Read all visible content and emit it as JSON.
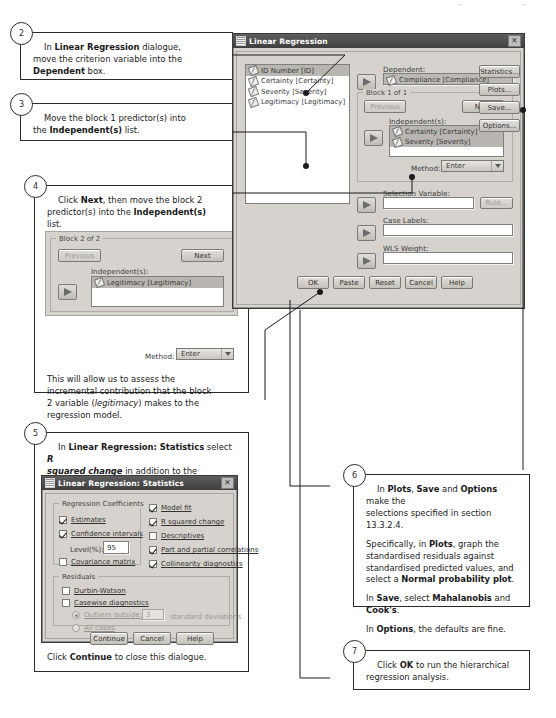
{
  "page": {
    "top_marks": [
      "⌐",
      "⌐"
    ]
  },
  "callouts": {
    "step2": {
      "number": "2",
      "text_html": "In <b>Linear Regression</b> dialogue, move the criterion variable into the <b>Dependent</b> box.",
      "line1_pre": "In ",
      "line1_bold": "Linear Regression",
      "line1_post": " dialogue,",
      "line2": "move the criterion variable into the",
      "line3_bold": "Dependent",
      "line3_post": " box."
    },
    "step3": {
      "number": "3",
      "line1": "Move the block 1 predictor(s) into",
      "line2_pre": "the ",
      "line2_bold": "Independent(s)",
      "line2_post": " list."
    },
    "step4": {
      "number": "4",
      "line1_pre": "Click ",
      "line1_bold": "Next",
      "line1_post": ", then move the block 2",
      "line2_pre": "predictor(s) into the ",
      "line2_bold": "Independent(s)",
      "line3": "list.",
      "note1": "This will allow us to assess the",
      "note2": "incremental contribution that the block",
      "note3_pre": "2 variable (",
      "note3_italic": "legitimacy",
      "note3_post": ") makes to the",
      "note4": "regression model."
    },
    "step5": {
      "number": "5",
      "line1_pre": "In ",
      "line1_bold": "Linear Regression: Statistics",
      "line1_post": " select ",
      "line1_bolditalic": "R",
      "line2_bolditalic": "squared change",
      "line2_post": " in addition to the selections",
      "line3": "made in section 13.3.2.4.",
      "footer_pre": "Click ",
      "footer_bold": "Continue",
      "footer_post": " to close this dialogue."
    },
    "step6": {
      "number": "6",
      "p1_a": "In ",
      "p1_b1": "Plots",
      "p1_b": ", ",
      "p1_b2": "Save",
      "p1_c": " and ",
      "p1_b3": "Options",
      "p1_d": " make the",
      "p1_l2": "selections specified in section 13.3.2.4.",
      "p2_a": "Specifically, in ",
      "p2_b1": "Plots",
      "p2_b": ", graph the",
      "p2_l2": "standardised residuals against",
      "p2_l3": "standardised predicted values, and",
      "p2_l4_a": "select a ",
      "p2_l4_b": "Normal probability plot",
      "p2_l4_c": ".",
      "p3_a": "In ",
      "p3_b1": "Save",
      "p3_b": ", select ",
      "p3_b2": "Mahalanobis",
      "p3_c": " and",
      "p3_l2_b": "Cook's",
      "p3_l2_c": ".",
      "p4_a": "In ",
      "p4_b1": "Options",
      "p4_b": ", the defaults are fine."
    },
    "step7": {
      "number": "7",
      "line1_pre": "Click ",
      "line1_bold": "OK",
      "line1_post": " to run the hierarchical",
      "line2": "regression analysis."
    }
  },
  "main_dialog": {
    "title": "Linear Regression",
    "close_label": "✕",
    "variables": [
      {
        "name": "ID Number [ID]",
        "icon": "ruler-icon",
        "selected": true
      },
      {
        "name": "Certainty [Certainty]",
        "icon": "ruler-icon",
        "selected": false
      },
      {
        "name": "Severity [Severity]",
        "icon": "ruler-icon",
        "selected": false
      },
      {
        "name": "Legitimacy [Legitimacy]",
        "icon": "ruler-icon",
        "selected": false
      }
    ],
    "dependent_label": "Dependent:",
    "dependent_value": "Compliance [Compliance]",
    "block_label": "Block 1 of 1",
    "previous_label": "Previous",
    "next_label": "Next",
    "independents_label": "Independent(s):",
    "independents": [
      "Certainty [Certainty]",
      "Severity [Severity]"
    ],
    "method_label": "Method:",
    "method_value": "Enter",
    "selection_label": "Selection Variable:",
    "selection_value": "",
    "rule_label": "Rule...",
    "case_labels_label": "Case Labels:",
    "case_labels_value": "",
    "wls_label": "WLS Weight:",
    "wls_value": "",
    "side_buttons": [
      "Statistics...",
      "Plots...",
      "Save...",
      "Options..."
    ],
    "bottom_buttons": [
      "OK",
      "Paste",
      "Reset",
      "Cancel",
      "Help"
    ]
  },
  "block2_inset": {
    "group_label": "Block 2 of 2",
    "previous_label": "Previous",
    "next_label": "Next",
    "independents_label": "Independent(s):",
    "independents": [
      "Legitimacy [Legitimacy]"
    ],
    "method_label": "Method:",
    "method_value": "Enter"
  },
  "stats_dialog": {
    "title": "Linear Regression: Statistics",
    "close_label": "✕",
    "group_coefficients": "Regression Coefficients",
    "coefficients": [
      {
        "label": "Estimates",
        "checked": true,
        "enabled": true
      },
      {
        "label": "Confidence intervals",
        "checked": true,
        "enabled": true
      },
      {
        "label": "Covariance matrix",
        "checked": false,
        "enabled": true
      }
    ],
    "level_label": "Level(%):",
    "level_value": "95",
    "right_options": [
      {
        "label": "Model fit",
        "checked": true
      },
      {
        "label": "R squared change",
        "checked": true
      },
      {
        "label": "Descriptives",
        "checked": false
      },
      {
        "label": "Part and partial correlations",
        "checked": true
      },
      {
        "label": "Collinearity diagnostics",
        "checked": true
      }
    ],
    "group_residuals": "Residuals",
    "residuals": [
      {
        "label": "Durbin-Watson",
        "checked": false
      },
      {
        "label": "Casewise diagnostics",
        "checked": false
      }
    ],
    "outliers_label": "Outliers outside:",
    "outliers_value": "3",
    "outliers_suffix": "standard deviations",
    "all_cases_label": "All cases",
    "buttons": [
      "Continue",
      "Cancel",
      "Help"
    ]
  }
}
